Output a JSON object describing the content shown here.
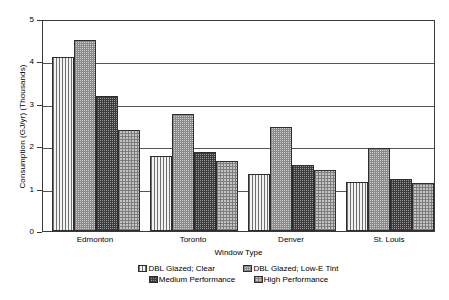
{
  "chart_data": {
    "type": "bar",
    "title": "",
    "xlabel": "Window Type",
    "ylabel": "Consumption (GJ/yr) (Thousands)",
    "categories": [
      "Edmonton",
      "Toronto",
      "Denver",
      "St. Louis"
    ],
    "series": [
      {
        "name": "DBL Glazed; Clear",
        "values": [
          4.1,
          1.78,
          1.35,
          1.15
        ],
        "pattern": "vertical-lines"
      },
      {
        "name": "DBL Glazed; Low-E Tint",
        "values": [
          4.5,
          2.76,
          2.46,
          1.95
        ],
        "pattern": "light-checker"
      },
      {
        "name": "Medium Performance",
        "values": [
          3.18,
          1.87,
          1.55,
          1.23
        ],
        "pattern": "dark-grid"
      },
      {
        "name": "High Performance",
        "values": [
          2.39,
          1.66,
          1.45,
          1.14
        ],
        "pattern": "medium-checker"
      }
    ],
    "ylim": [
      0,
      5
    ],
    "yticks": [
      0,
      1,
      2,
      3,
      4,
      5
    ],
    "ytick_labels": [
      "0",
      "1",
      "2",
      "3",
      "4",
      "5"
    ],
    "grid": "horizontal",
    "legend_position": "bottom"
  },
  "axis": {
    "y_title": "Consumption (GJ/yr) (Thousands)",
    "x_title": "Window Type",
    "tick_0": "0",
    "tick_1": "1",
    "tick_2": "2",
    "tick_3": "3",
    "tick_4": "4",
    "tick_5": "5"
  },
  "xticks": {
    "t0": "Edmonton",
    "t1": "Toronto",
    "t2": "Denver",
    "t3": "St. Louis"
  },
  "legend": {
    "item0": "DBL Glazed; Clear",
    "item1": "DBL Glazed; Low-E Tint",
    "item2": "Medium Performance",
    "item3": "High Performance"
  },
  "colors": {
    "axis": "#3a3a3a",
    "grid": "#555555",
    "bar_outline": "#2e2e2e",
    "background": "#ffffff"
  }
}
